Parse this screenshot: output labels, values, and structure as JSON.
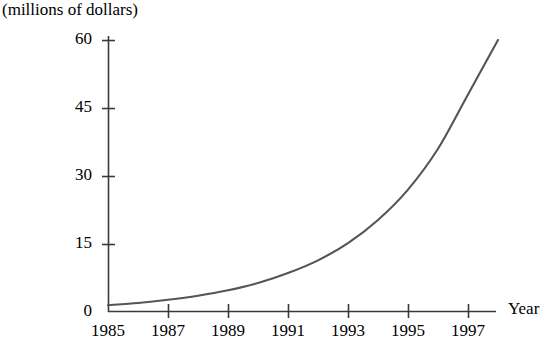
{
  "chart_data": {
    "type": "line",
    "title": "",
    "ylabel": "(millions of dollars)",
    "xlabel": "Year",
    "xlim": [
      1985,
      1998
    ],
    "ylim": [
      0,
      62
    ],
    "grid": false,
    "legend": null,
    "yticks": [
      "0",
      "15",
      "30",
      "45",
      "60"
    ],
    "ytick_values": [
      0,
      15,
      30,
      45,
      60
    ],
    "xticks": [
      "1985",
      "1987",
      "1989",
      "1991",
      "1993",
      "1995",
      "1997"
    ],
    "xtick_values": [
      1985,
      1987,
      1989,
      1991,
      1993,
      1995,
      1997
    ],
    "series": [
      {
        "name": "revenue",
        "color": "#555555",
        "x": [
          1985,
          1986,
          1987,
          1988,
          1989,
          1990,
          1991,
          1992,
          1993,
          1994,
          1995,
          1996,
          1997,
          1998
        ],
        "values": [
          1.5,
          2.0,
          2.7,
          3.6,
          4.8,
          6.4,
          8.6,
          11.4,
          15.2,
          20.3,
          27.0,
          36.0,
          48.0,
          60.0
        ]
      }
    ]
  },
  "axis_geometry": {
    "x_origin_px": 108,
    "y_baseline_px": 312,
    "px_per_year": 30,
    "px_per_unit": 4.533,
    "x_axis_end_px": 496,
    "y_axis_top_px": 36
  },
  "labels": {
    "y_axis_caption": "(millions of dollars)",
    "x_axis_caption": "Year"
  },
  "colors": {
    "curve": "#555555",
    "axis": "#3a3a3a",
    "text": "#000000",
    "background": "#ffffff"
  }
}
